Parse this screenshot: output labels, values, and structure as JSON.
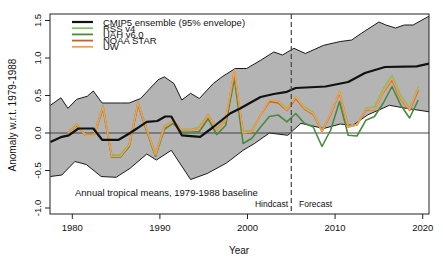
{
  "chart_data": {
    "type": "line",
    "title": "",
    "xlabel": "Year",
    "ylabel": "Anomaly w.r.t. 1979-1988",
    "xlim": [
      1977.5,
      2020.9
    ],
    "ylim": [
      -1.1,
      1.6
    ],
    "x_ticks": [
      1980,
      1990,
      2000,
      2010,
      2020
    ],
    "x_tick_labels": [
      "1980",
      "1990",
      "2000",
      "2010",
      "2020"
    ],
    "y_ticks": [
      -1.0,
      -0.5,
      0.0,
      0.5,
      1.0,
      1.5
    ],
    "y_tick_labels": [
      "-1.0",
      "-0.5",
      "0.0",
      "0.5",
      "1.0",
      "1.5"
    ],
    "grid": false,
    "reference_line_y": 0.0,
    "divider": {
      "x": 2005,
      "style": "dashed",
      "left_label": "Hindcast",
      "right_label": "Forecast"
    },
    "annotation": "Annual tropical means, 1979-1988 baseline",
    "legend": {
      "position": "top-left",
      "entries": [
        {
          "label": "CMIP5 ensemble (95% envelope)",
          "color": "#111111"
        },
        {
          "label": "RSS v4",
          "color": "#86c066"
        },
        {
          "label": "UAH v6.0",
          "color": "#4a8a3c"
        },
        {
          "label": "NOAA STAR",
          "color": "#c8602a"
        },
        {
          "label": "UW",
          "color": "#f0a050"
        }
      ]
    },
    "envelope": {
      "name": "CMIP5 95% envelope",
      "fill": "#b4b4b4",
      "x": [
        1977.5,
        1978.7,
        1979.5,
        1980.5,
        1981.7,
        1982.4,
        1983.4,
        1985.5,
        1986.5,
        1987.8,
        1989.8,
        1990.5,
        1991.6,
        1992.5,
        1993.5,
        1994.5,
        1996.1,
        1997.1,
        1998.6,
        1999.9,
        2001.5,
        2003.0,
        2004.0,
        2005.3,
        2006.6,
        2008.7,
        2010.6,
        2011.9,
        2013.0,
        2015.0,
        2015.8,
        2016.9,
        2017.9,
        2018.9,
        2020.9
      ],
      "upper": [
        0.37,
        0.47,
        0.33,
        0.45,
        0.49,
        0.56,
        0.4,
        0.4,
        0.4,
        0.46,
        0.71,
        0.75,
        0.66,
        0.44,
        0.53,
        0.46,
        0.66,
        0.75,
        0.86,
        0.86,
        0.97,
        1.08,
        1.04,
        1.13,
        1.06,
        1.17,
        1.22,
        1.24,
        1.33,
        1.48,
        1.44,
        1.4,
        1.44,
        1.44,
        1.57
      ],
      "lower_x": [
        1977.5,
        1978.8,
        1980.3,
        1981.6,
        1983.3,
        1985.0,
        1986.6,
        1988.5,
        1989.6,
        1991.3,
        1993.5,
        1995.4,
        1997.6,
        1999.5,
        2000.8,
        2002.5,
        2004.6,
        2006.1,
        2008.7,
        2010.6,
        2012.0,
        2013.7,
        2016.2,
        2018.1,
        2020.9
      ],
      "lower": [
        -0.58,
        -0.56,
        -0.38,
        -0.42,
        -0.58,
        -0.59,
        -0.47,
        -0.28,
        -0.36,
        -0.23,
        -0.62,
        -0.54,
        -0.4,
        -0.23,
        -0.14,
        0.0,
        -0.03,
        0.13,
        0.06,
        0.12,
        0.1,
        0.24,
        0.37,
        0.33,
        0.28
      ]
    },
    "series": [
      {
        "name": "CMIP5 ensemble mean",
        "color": "#111111",
        "width": 2.2,
        "x": [
          1977.5,
          1978.8,
          1979.6,
          1980.7,
          1982.4,
          1983.4,
          1985.3,
          1986.6,
          1988.5,
          1989.7,
          1990.6,
          1991.3,
          1992.5,
          1994.6,
          1996.1,
          1998.0,
          1999.2,
          2001.5,
          2003.0,
          2004.5,
          2005.5,
          2008.9,
          2011.5,
          2013.4,
          2015.7,
          2019.3,
          2020.9
        ],
        "values": [
          -0.12,
          -0.05,
          -0.03,
          0.06,
          0.06,
          -0.09,
          -0.09,
          0.0,
          0.15,
          0.16,
          0.22,
          0.22,
          -0.03,
          -0.05,
          0.08,
          0.26,
          0.33,
          0.48,
          0.52,
          0.55,
          0.6,
          0.62,
          0.68,
          0.8,
          0.88,
          0.89,
          0.93
        ]
      },
      {
        "name": "RSS v4",
        "color": "#86c066",
        "width": 1.6,
        "years": [
          1979,
          1980,
          1981,
          1982,
          1983,
          1984,
          1985,
          1986,
          1987,
          1988,
          1989,
          1990,
          1991,
          1992,
          1993,
          1994,
          1995,
          1996,
          1997,
          1998,
          1999,
          2000,
          2001,
          2002,
          2003,
          2004,
          2005,
          2006,
          2007,
          2008,
          2009,
          2010,
          2011,
          2012,
          2013,
          2014,
          2015,
          2016,
          2017,
          2018,
          2019
        ],
        "values": [
          0.01,
          0.12,
          -0.02,
          -0.02,
          0.37,
          -0.29,
          -0.29,
          -0.15,
          0.41,
          0.05,
          -0.28,
          0.09,
          0.16,
          0.05,
          0.05,
          0.08,
          0.25,
          0.06,
          0.19,
          0.8,
          0.02,
          0.04,
          0.24,
          0.44,
          0.43,
          0.33,
          0.48,
          0.35,
          0.28,
          0.03,
          0.26,
          0.56,
          0.09,
          0.11,
          0.33,
          0.35,
          0.59,
          0.77,
          0.5,
          0.33,
          0.62
        ]
      },
      {
        "name": "UAH v6.0",
        "color": "#4a8a3c",
        "width": 1.6,
        "years": [
          1979,
          1980,
          1981,
          1982,
          1983,
          1984,
          1985,
          1986,
          1987,
          1988,
          1989,
          1990,
          1991,
          1992,
          1993,
          1994,
          1995,
          1996,
          1997,
          1998,
          1999,
          2000,
          2001,
          2002,
          2003,
          2004,
          2005,
          2006,
          2007,
          2008,
          2009,
          2010,
          2011,
          2012,
          2013,
          2014,
          2015,
          2016,
          2017,
          2018,
          2019
        ],
        "values": [
          0.0,
          0.1,
          -0.03,
          -0.03,
          0.33,
          -0.32,
          -0.32,
          -0.18,
          0.38,
          0.02,
          -0.31,
          0.05,
          0.13,
          0.01,
          0.01,
          0.02,
          0.19,
          -0.02,
          0.1,
          0.73,
          -0.14,
          -0.07,
          0.08,
          0.22,
          0.24,
          0.15,
          0.26,
          0.13,
          0.08,
          -0.18,
          0.04,
          0.42,
          -0.03,
          -0.04,
          0.17,
          0.22,
          0.4,
          0.62,
          0.37,
          0.2,
          0.44
        ]
      },
      {
        "name": "NOAA STAR",
        "color": "#c8602a",
        "width": 1.6,
        "years": [
          1979,
          1980,
          1981,
          1982,
          1983,
          1984,
          1985,
          1986,
          1987,
          1988,
          1989,
          1990,
          1991,
          1992,
          1993,
          1994,
          1995,
          1996,
          1997,
          1998,
          1999,
          2000,
          2001,
          2002,
          2003,
          2004,
          2005,
          2006,
          2007,
          2008,
          2009,
          2010,
          2011,
          2012,
          2013,
          2014,
          2015,
          2016,
          2017,
          2018,
          2019
        ],
        "values": [
          0.0,
          0.11,
          -0.03,
          -0.03,
          0.35,
          -0.31,
          -0.31,
          -0.16,
          0.4,
          0.04,
          -0.29,
          0.08,
          0.15,
          0.04,
          0.04,
          0.06,
          0.24,
          0.04,
          0.17,
          0.82,
          0.0,
          0.02,
          0.24,
          0.42,
          0.4,
          0.3,
          0.46,
          0.32,
          0.25,
          0.02,
          0.25,
          0.54,
          0.08,
          0.11,
          0.3,
          0.31,
          0.54,
          0.71,
          0.45,
          0.3,
          0.57
        ]
      },
      {
        "name": "UW",
        "color": "#f0a050",
        "width": 1.6,
        "years": [
          1979,
          1980,
          1981,
          1982,
          1983,
          1984,
          1985,
          1986,
          1987,
          1988,
          1989,
          1990,
          1991,
          1992,
          1993,
          1994,
          1995,
          1996,
          1997,
          1998,
          1999,
          2000,
          2001,
          2002,
          2003,
          2004,
          2005,
          2006,
          2007,
          2008,
          2009,
          2010,
          2011,
          2012,
          2013,
          2014,
          2015,
          2016,
          2017,
          2018,
          2019
        ],
        "values": [
          0.0,
          0.11,
          -0.03,
          -0.03,
          0.35,
          -0.31,
          -0.31,
          -0.16,
          0.4,
          0.04,
          -0.29,
          0.08,
          0.15,
          0.04,
          0.04,
          0.06,
          0.24,
          0.04,
          0.17,
          0.84,
          0.0,
          0.02,
          0.24,
          0.44,
          0.42,
          0.31,
          0.48,
          0.33,
          0.26,
          0.02,
          0.26,
          0.55,
          0.08,
          0.11,
          0.31,
          0.31,
          0.55,
          0.73,
          0.46,
          0.31,
          0.6
        ]
      }
    ]
  }
}
